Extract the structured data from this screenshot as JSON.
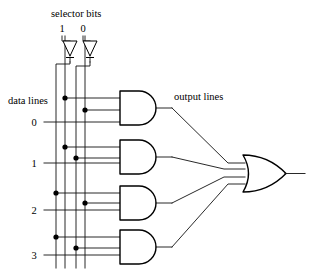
{
  "diagram": {
    "kind": "logic-circuit",
    "labels": {
      "selector_bits": "selector bits",
      "data_lines": "data lines",
      "output_lines": "output lines"
    },
    "selector_bits": [
      {
        "label": "1",
        "x": 65
      },
      {
        "label": "0",
        "x": 85
      }
    ],
    "selector_rails": [
      {
        "name": "s1-bar",
        "x": 56
      },
      {
        "name": "s1",
        "x": 65
      },
      {
        "name": "s0-bar",
        "x": 76
      },
      {
        "name": "s0",
        "x": 85
      }
    ],
    "inverters": [
      {
        "name": "inverter-s1",
        "cx": 70,
        "top": 40,
        "bottom": 58
      },
      {
        "name": "inverter-s0",
        "cx": 90,
        "top": 40,
        "bottom": 58
      }
    ],
    "data_lines": [
      {
        "label": "0",
        "y": 122
      },
      {
        "label": "1",
        "y": 163
      },
      {
        "label": "2",
        "y": 210
      },
      {
        "label": "3",
        "y": 255
      }
    ],
    "and_gates": [
      {
        "name": "and-gate-0",
        "top": 91,
        "bottom": 125,
        "left": 120,
        "right": 158,
        "inputs": [
          {
            "y": 98,
            "rail": 65
          },
          {
            "y": 110,
            "rail": 85
          },
          {
            "y": 122,
            "rail": null
          }
        ]
      },
      {
        "name": "and-gate-1",
        "top": 140,
        "bottom": 174,
        "left": 120,
        "right": 158,
        "inputs": [
          {
            "y": 147,
            "rail": 65
          },
          {
            "y": 158,
            "rail": 76
          },
          {
            "y": 163,
            "rail": null
          }
        ]
      },
      {
        "name": "and-gate-2",
        "top": 186,
        "bottom": 220,
        "left": 120,
        "right": 158,
        "inputs": [
          {
            "y": 193,
            "rail": 56
          },
          {
            "y": 203,
            "rail": 85
          },
          {
            "y": 210,
            "rail": null
          }
        ]
      },
      {
        "name": "and-gate-3",
        "top": 230,
        "bottom": 264,
        "left": 120,
        "right": 158,
        "inputs": [
          {
            "y": 237,
            "rail": 56
          },
          {
            "y": 248,
            "rail": 76
          },
          {
            "y": 255,
            "rail": null
          }
        ]
      }
    ],
    "or_gate": {
      "name": "or-gate",
      "left": 243,
      "right": 286,
      "top": 155,
      "bottom": 192,
      "input_count": 4,
      "output_y": 173,
      "output_end": 305
    },
    "junction_dots": [
      {
        "x": 65,
        "y": 98
      },
      {
        "x": 85,
        "y": 110
      },
      {
        "x": 65,
        "y": 147
      },
      {
        "x": 76,
        "y": 158
      },
      {
        "x": 56,
        "y": 193
      },
      {
        "x": 85,
        "y": 203
      },
      {
        "x": 56,
        "y": 237
      },
      {
        "x": 76,
        "y": 248
      }
    ],
    "colors": {
      "ink": "#000000",
      "wire": "#111111",
      "background": "#ffffff"
    }
  }
}
